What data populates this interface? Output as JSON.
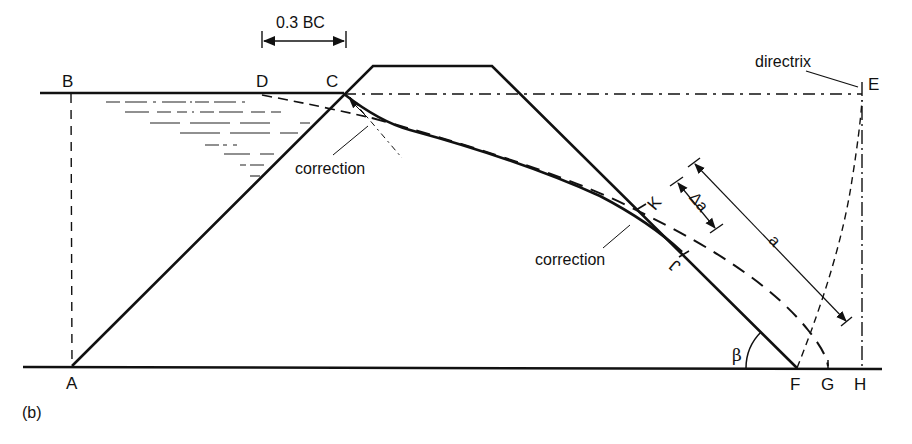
{
  "figure": {
    "panel_label": "(b)",
    "colors": {
      "ink": "#111111",
      "background": "#ffffff"
    }
  },
  "points": {
    "A": "A",
    "B": "B",
    "C": "C",
    "D": "D",
    "E": "E",
    "F": "F",
    "G": "G",
    "H": "H",
    "J": "J",
    "K": "K"
  },
  "annotations": {
    "dimension_top": "0.3 BC",
    "directrix": "directrix",
    "correction_upstream": "correction",
    "correction_downstream": "correction",
    "delta_a": "Δa",
    "a": "a",
    "beta": "β"
  }
}
